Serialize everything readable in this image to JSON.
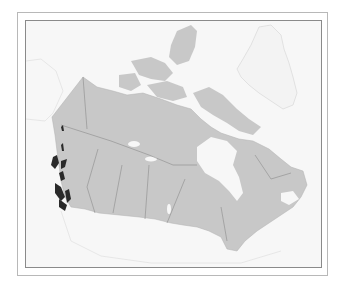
{
  "map": {
    "subject": "Canada",
    "type": "species range map",
    "colors": {
      "background": "#f7f7f7",
      "land_canada": "#c8c8c8",
      "land_other": "#f3f3f3",
      "water": "#f7f7f7",
      "borders": "#8c8c8c",
      "range_highlight": "#2a2a2a",
      "frame_outer": "#b8b8b8",
      "frame_inner": "#8a8a8a"
    },
    "highlighted_region": "Pacific coast of British Columbia",
    "labels": []
  }
}
